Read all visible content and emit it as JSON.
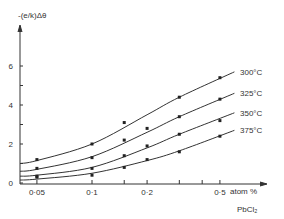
{
  "chart_data": {
    "type": "line",
    "title": "",
    "ylabel": "-(e/k)Δθ",
    "xlabel": "atom %",
    "xlabel2": "PbCl₂",
    "xscale": "log",
    "xlim": [
      0.04,
      0.6
    ],
    "ylim": [
      0,
      7.5
    ],
    "yticks": [
      0,
      1,
      2,
      3,
      4,
      5,
      6
    ],
    "ytick_labels": [
      "0",
      "",
      "2",
      "",
      "4",
      "",
      "6"
    ],
    "xticks": [
      0.05,
      0.1,
      0.15,
      0.2,
      0.3,
      0.4,
      0.5
    ],
    "xtick_labels": [
      "0·05",
      "0·1",
      "",
      "0·2",
      "",
      "",
      "0·5"
    ],
    "grid": false,
    "legend_position": "inline-right",
    "series": [
      {
        "name": "300°C",
        "points": [
          [
            0.05,
            1.2
          ],
          [
            0.1,
            2.0
          ],
          [
            0.15,
            3.1
          ],
          [
            0.3,
            4.4
          ],
          [
            0.5,
            5.4
          ]
        ],
        "curve": [
          [
            0.04,
            1.0
          ],
          [
            0.05,
            1.15
          ],
          [
            0.1,
            2.0
          ],
          [
            0.2,
            3.5
          ],
          [
            0.3,
            4.4
          ],
          [
            0.6,
            5.7
          ]
        ]
      },
      {
        "name": "325°C",
        "points": [
          [
            0.05,
            0.75
          ],
          [
            0.1,
            1.3
          ],
          [
            0.15,
            2.2
          ],
          [
            0.2,
            2.8
          ],
          [
            0.3,
            3.4
          ],
          [
            0.5,
            4.3
          ]
        ],
        "curve": [
          [
            0.04,
            0.6
          ],
          [
            0.05,
            0.7
          ],
          [
            0.1,
            1.35
          ],
          [
            0.2,
            2.6
          ],
          [
            0.3,
            3.4
          ],
          [
            0.6,
            4.6
          ]
        ]
      },
      {
        "name": "350°C",
        "points": [
          [
            0.05,
            0.3
          ],
          [
            0.1,
            0.75
          ],
          [
            0.15,
            1.4
          ],
          [
            0.2,
            1.9
          ],
          [
            0.3,
            2.5
          ],
          [
            0.5,
            3.2
          ]
        ],
        "curve": [
          [
            0.04,
            0.35
          ],
          [
            0.05,
            0.4
          ],
          [
            0.1,
            0.8
          ],
          [
            0.2,
            1.8
          ],
          [
            0.3,
            2.5
          ],
          [
            0.6,
            3.6
          ]
        ]
      },
      {
        "name": "375°C",
        "points": [
          [
            0.05,
            0.35
          ],
          [
            0.1,
            0.4
          ],
          [
            0.15,
            0.8
          ],
          [
            0.2,
            1.2
          ],
          [
            0.3,
            1.6
          ],
          [
            0.5,
            2.4
          ]
        ],
        "curve": [
          [
            0.04,
            0.15
          ],
          [
            0.05,
            0.2
          ],
          [
            0.1,
            0.5
          ],
          [
            0.2,
            1.15
          ],
          [
            0.3,
            1.65
          ],
          [
            0.6,
            2.7
          ]
        ]
      }
    ]
  }
}
